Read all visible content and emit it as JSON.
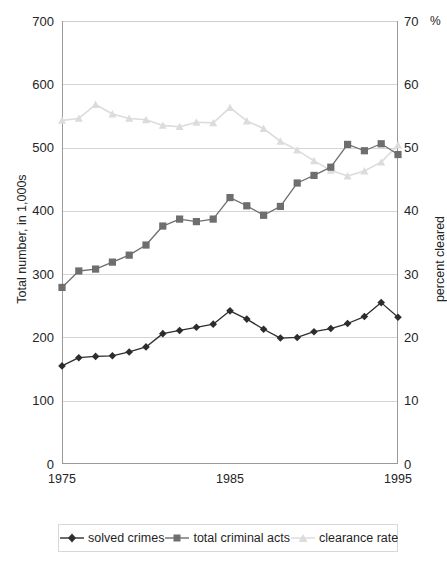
{
  "chart_data": {
    "type": "line",
    "title": "",
    "subtitle": "",
    "xlabel": "",
    "ylabel": "Total number, in 1,000s",
    "y2label": "percent cleared",
    "y2unit": "%",
    "grid": true,
    "legend_position": "bottom",
    "x": [
      1975,
      1976,
      1977,
      1978,
      1979,
      1980,
      1981,
      1982,
      1983,
      1984,
      1985,
      1986,
      1987,
      1988,
      1989,
      1990,
      1991,
      1992,
      1993,
      1994,
      1995
    ],
    "x_tick_labels": [
      "1975",
      "1985",
      "1995"
    ],
    "x_tick_values": [
      1975,
      1985,
      1995
    ],
    "ylim": [
      0,
      700
    ],
    "y_ticks": [
      0,
      100,
      200,
      300,
      400,
      500,
      600,
      700
    ],
    "y2lim": [
      0,
      70
    ],
    "y2_ticks": [
      0,
      10,
      20,
      30,
      40,
      50,
      60,
      70
    ],
    "series": [
      {
        "name": "solved crimes",
        "axis": "left",
        "marker": "diamond",
        "color": "#2d2d2d",
        "values": [
          155,
          168,
          170,
          171,
          177,
          185,
          206,
          211,
          216,
          221,
          242,
          229,
          213,
          199,
          200,
          209,
          214,
          222,
          233,
          255,
          232
        ]
      },
      {
        "name": "total criminal acts",
        "axis": "left",
        "marker": "square",
        "color": "#6e6e6e",
        "values": [
          279,
          305,
          308,
          319,
          330,
          346,
          376,
          387,
          383,
          387,
          421,
          408,
          393,
          407,
          444,
          456,
          469,
          505,
          495,
          506,
          489
        ]
      },
      {
        "name": "clearance rate",
        "axis": "right",
        "marker": "triangle",
        "color": "#dcdcdc",
        "values": [
          54.3,
          54.6,
          56.8,
          55.3,
          54.6,
          54.4,
          53.5,
          53.3,
          54.0,
          53.9,
          56.3,
          54.2,
          53.0,
          51.0,
          49.6,
          47.9,
          46.4,
          45.5,
          46.3,
          47.7,
          50.4
        ]
      }
    ]
  },
  "axes": {
    "left": {
      "title": "Total number, in 1,000s",
      "ticks": [
        "0",
        "100",
        "200",
        "300",
        "400",
        "500",
        "600",
        "700"
      ]
    },
    "right": {
      "title": "percent cleared",
      "unit": "%",
      "ticks": [
        "0",
        "10",
        "20",
        "30",
        "40",
        "50",
        "60",
        "70"
      ]
    },
    "bottom": {
      "ticks": [
        "1975",
        "1985",
        "1995"
      ]
    }
  },
  "legend": {
    "items": [
      {
        "label": "solved crimes",
        "marker": "diamond-marker",
        "color": "#2d2d2d"
      },
      {
        "label": "total criminal acts",
        "marker": "square-marker",
        "color": "#6e6e6e"
      },
      {
        "label": "clearance rate",
        "marker": "triangle-marker",
        "color": "#dcdcdc"
      }
    ]
  }
}
